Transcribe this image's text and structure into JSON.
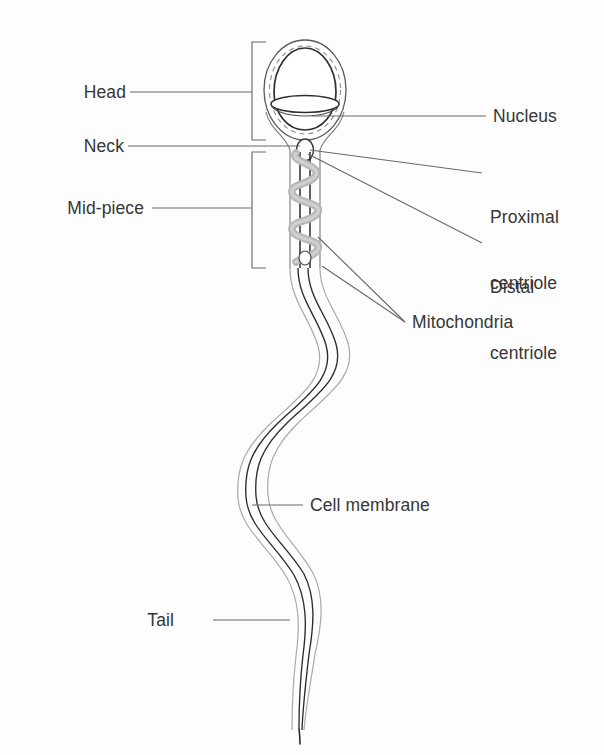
{
  "figure": {
    "type": "biology-diagram",
    "background_color": "#fdfdfd",
    "ink_color": "#363636",
    "line_color": "#555555",
    "mitochondria_color": "#b6b6b6"
  },
  "labels": {
    "head": "Head",
    "neck": "Neck",
    "mid_piece": "Mid-piece",
    "nucleus": "Nucleus",
    "proximal_centriole_line1": "Proximal",
    "proximal_centriole_line2": "centriole",
    "distal_centriole_line1": "Distal",
    "distal_centriole_line2": "centriole",
    "mitochondria": "Mitochondria",
    "cell_membrane": "Cell membrane",
    "tail": "Tail"
  },
  "parts": [
    {
      "name": "Head",
      "side": "left",
      "marker": "bracket"
    },
    {
      "name": "Neck",
      "side": "left",
      "marker": "leader-line"
    },
    {
      "name": "Mid-piece",
      "side": "left",
      "marker": "bracket"
    },
    {
      "name": "Nucleus",
      "side": "right",
      "marker": "leader-line"
    },
    {
      "name": "Proximal centriole",
      "side": "right",
      "marker": "leader-line"
    },
    {
      "name": "Distal centriole",
      "side": "right",
      "marker": "leader-line"
    },
    {
      "name": "Mitochondria",
      "side": "right",
      "marker": "double-leader-line"
    },
    {
      "name": "Cell membrane",
      "side": "right",
      "marker": "leader-line"
    },
    {
      "name": "Tail",
      "side": "left",
      "marker": "leader-line"
    }
  ]
}
